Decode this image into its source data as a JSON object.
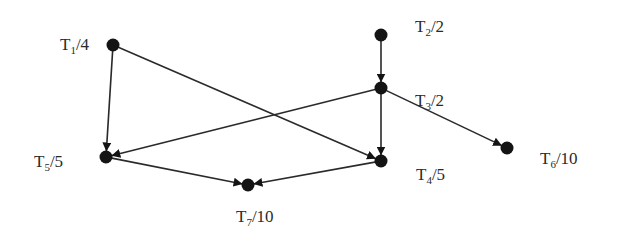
{
  "diagram": {
    "type": "task-graph",
    "colors": {
      "node": "#141414",
      "edge": "#2a2a2a",
      "text": "#2a2a2a",
      "background": "#ffffff"
    },
    "nodes": [
      {
        "id": "T1",
        "sub": "1",
        "weight": "4",
        "x": 113,
        "y": 45,
        "label_x": 60,
        "label_y": 36
      },
      {
        "id": "T2",
        "sub": "2",
        "weight": "2",
        "x": 381,
        "y": 35,
        "label_x": 415,
        "label_y": 18
      },
      {
        "id": "T3",
        "sub": "3",
        "weight": "2",
        "x": 381,
        "y": 88,
        "label_x": 415,
        "label_y": 92
      },
      {
        "id": "T4",
        "sub": "5",
        "weight": "5",
        "x": 381,
        "y": 161,
        "label_x": 416,
        "label_y": 166
      },
      {
        "id": "T5",
        "sub": "5",
        "weight": "5",
        "x": 106,
        "y": 157,
        "label_x": 34,
        "label_y": 153
      },
      {
        "id": "T6",
        "sub": "6",
        "weight": "10",
        "x": 507,
        "y": 148,
        "label_x": 540,
        "label_y": 150
      },
      {
        "id": "T7",
        "sub": "7",
        "weight": "10",
        "x": 248,
        "y": 185,
        "label_x": 236,
        "label_y": 208
      }
    ],
    "labels": {
      "T1": {
        "prefix": "T",
        "sub": "1",
        "suffix": "/4"
      },
      "T2": {
        "prefix": "T",
        "sub": "2",
        "suffix": "/2"
      },
      "T3": {
        "prefix": "T",
        "sub": "3",
        "suffix": "/2"
      },
      "T4": {
        "prefix": "T",
        "sub": "4",
        "suffix": "/5"
      },
      "T5": {
        "prefix": "T",
        "sub": "5",
        "suffix": "/5"
      },
      "T6": {
        "prefix": "T",
        "sub": "6",
        "suffix": "/10"
      },
      "T7": {
        "prefix": "T",
        "sub": "7",
        "suffix": "/10"
      }
    },
    "edges": [
      {
        "from": "T1",
        "to": "T5"
      },
      {
        "from": "T1",
        "to": "T4"
      },
      {
        "from": "T2",
        "to": "T3"
      },
      {
        "from": "T3",
        "to": "T5"
      },
      {
        "from": "T3",
        "to": "T4"
      },
      {
        "from": "T3",
        "to": "T6"
      },
      {
        "from": "T5",
        "to": "T7"
      },
      {
        "from": "T4",
        "to": "T7"
      }
    ]
  }
}
